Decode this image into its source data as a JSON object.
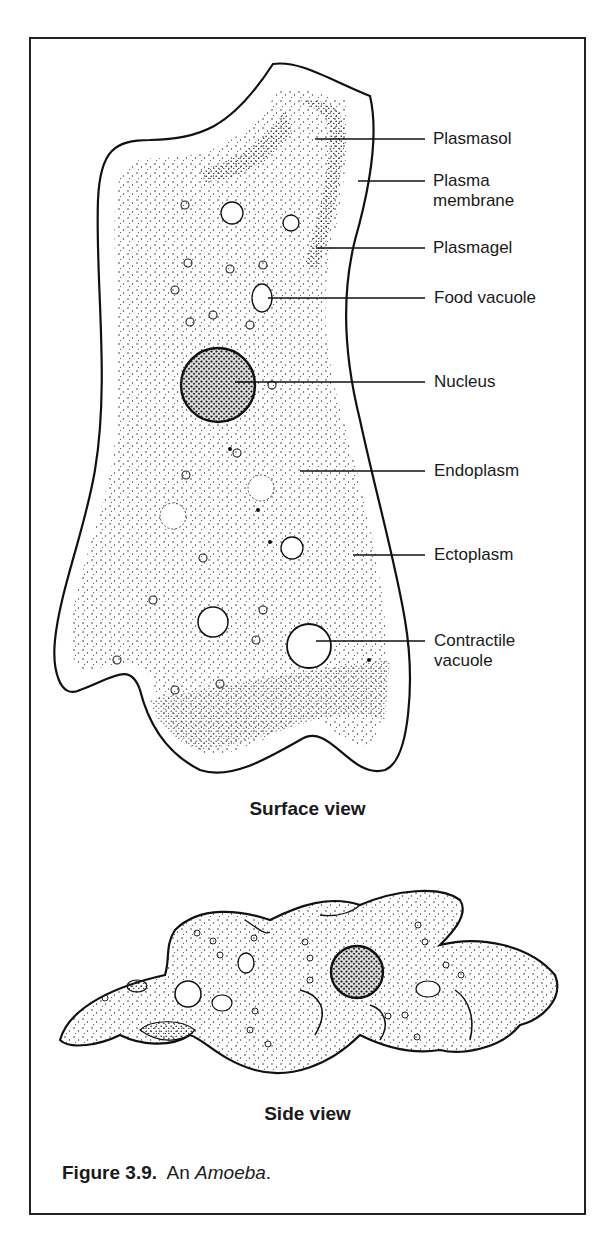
{
  "figure": {
    "number": "Figure 3.9.",
    "title_prefix": "An",
    "title_italic": "Amoeba",
    "title_suffix": "."
  },
  "views": {
    "surface": "Surface view",
    "side": "Side view"
  },
  "labels": [
    {
      "id": "plasmasol",
      "line1": "Plasmasol",
      "line2": ""
    },
    {
      "id": "plasma-membrane",
      "line1": "Plasma",
      "line2": "membrane"
    },
    {
      "id": "plasmagel",
      "line1": "Plasmagel",
      "line2": ""
    },
    {
      "id": "food-vacuole",
      "line1": "Food vacuole",
      "line2": ""
    },
    {
      "id": "nucleus",
      "line1": "Nucleus",
      "line2": ""
    },
    {
      "id": "endoplasm",
      "line1": "Endoplasm",
      "line2": ""
    },
    {
      "id": "ectoplasm",
      "line1": "Ectoplasm",
      "line2": ""
    },
    {
      "id": "contractile-vacuole",
      "line1": "Contractile",
      "line2": "vacuole"
    }
  ],
  "colors": {
    "ink": "#1a1a1a",
    "background": "#ffffff"
  }
}
